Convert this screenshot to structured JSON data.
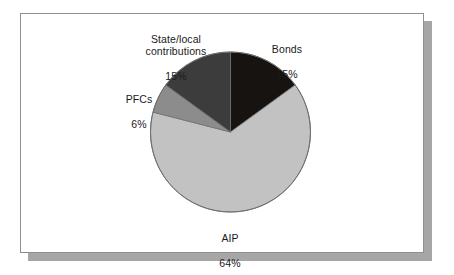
{
  "figure": {
    "background_color": "#ffffff",
    "panel_border_color": "#8f8f8f",
    "panel_shadow_color": "#a6a6a6"
  },
  "chart_data": {
    "type": "pie",
    "title": "",
    "subtitle": "",
    "xlabel": "",
    "ylabel": "",
    "legend_position": "none",
    "labels_position": "outside-callout",
    "grid": false,
    "start_angle_deg": 0,
    "direction": "clockwise",
    "units": "percent",
    "total": 100,
    "categories": [
      "Bonds",
      "AIP",
      "PFCs",
      "State/local contributions"
    ],
    "values": [
      15,
      64,
      6,
      15
    ],
    "value_labels": [
      "15%",
      "64%",
      "6%",
      "15%"
    ],
    "colors": [
      "#171310",
      "#c2c2c2",
      "#8c8c8c",
      "#3c3c3c"
    ],
    "slices": [
      {
        "name": "Bonds",
        "value": 15,
        "value_label": "15%",
        "color": "#171310",
        "start_angle_deg": 0,
        "end_angle_deg": 54
      },
      {
        "name": "AIP",
        "value": 64,
        "value_label": "64%",
        "color": "#c2c2c2",
        "start_angle_deg": 54,
        "end_angle_deg": 284.4
      },
      {
        "name": "PFCs",
        "value": 6,
        "value_label": "6%",
        "color": "#8c8c8c",
        "start_angle_deg": 284.4,
        "end_angle_deg": 306
      },
      {
        "name": "State/local contributions",
        "value": 15,
        "value_label": "15%",
        "color": "#3c3c3c",
        "start_angle_deg": 306,
        "end_angle_deg": 360
      }
    ]
  },
  "labels": {
    "state_local": {
      "name": "State/local\ncontributions",
      "value": "15%"
    },
    "bonds": {
      "name": "Bonds",
      "value": "15%"
    },
    "pfcs": {
      "name": "PFCs",
      "value": "6%"
    },
    "aip": {
      "name": "AIP",
      "value": "64%"
    }
  }
}
